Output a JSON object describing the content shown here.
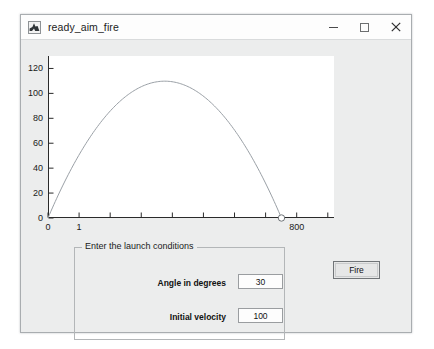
{
  "window": {
    "title": "ready_aim_fire",
    "icon": "matlab-app-icon",
    "controls": [
      {
        "name": "minimize",
        "glyph": "–"
      },
      {
        "name": "maximize",
        "glyph": "□"
      },
      {
        "name": "close",
        "glyph": "×"
      }
    ]
  },
  "chart_data": {
    "type": "line",
    "title": "",
    "xlabel": "",
    "ylabel": "",
    "xlim": [
      0,
      920
    ],
    "ylim": [
      0,
      130
    ],
    "grid": false,
    "legend": null,
    "x_ticks": [
      0,
      100,
      200,
      300,
      400,
      500,
      600,
      700,
      800,
      900
    ],
    "x_tick_labels": [
      "0",
      "1",
      "",
      "",
      "",
      "",
      "",
      "",
      "800",
      ""
    ],
    "y_ticks": [
      0,
      20,
      40,
      60,
      80,
      100,
      120
    ],
    "y_tick_labels": [
      "0",
      "20",
      "40",
      "60",
      "80",
      "100",
      "120"
    ],
    "series": [
      {
        "name": "trajectory",
        "color": "#9aa0a6",
        "marker_end": "circle",
        "x": [
          0,
          44,
          88,
          133,
          177,
          221,
          265,
          309,
          354,
          398,
          442,
          486,
          530,
          575,
          619,
          663,
          707,
          751,
          796,
          840,
          884
        ],
        "y": [
          0,
          24.3,
          45.6,
          63.9,
          79.2,
          91.4,
          100.6,
          106.7,
          109.8,
          109.8,
          106.7,
          100.6,
          91.4,
          79.2,
          63.9,
          45.6,
          24.3,
          0,
          0,
          0,
          0
        ]
      }
    ]
  },
  "panel": {
    "title": "Enter the launch conditions",
    "fields": [
      {
        "label": "Angle in degrees",
        "value": "30"
      },
      {
        "label": "Initial velocity",
        "value": "100"
      }
    ]
  },
  "fire_button": {
    "label": "Fire"
  }
}
